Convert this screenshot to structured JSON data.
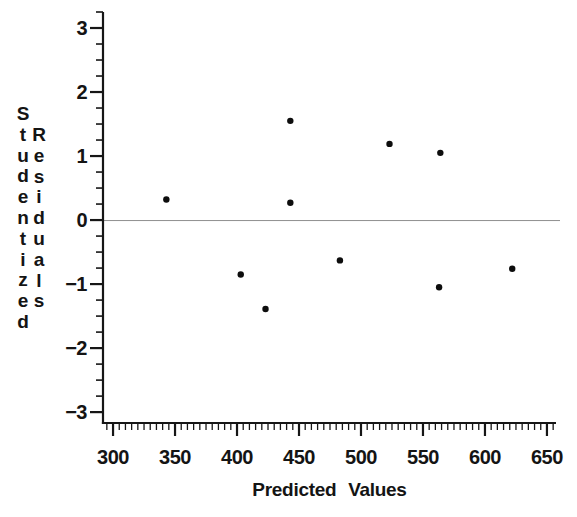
{
  "figure": {
    "xlabel": "Predicted Values",
    "ylabel": "Studentized Residuals",
    "ylabel_words": [
      "Studentized",
      "Residuals"
    ],
    "background_color": "#ffffff",
    "axis_color": "#161616",
    "text_color": "#141414"
  },
  "chart_data": {
    "type": "scatter",
    "title": "",
    "xlabel": "Predicted Values",
    "ylabel": "Studentized Residuals",
    "xlim": [
      291.9,
      657.3
    ],
    "ylim": [
      -3.17,
      3.25
    ],
    "grid": false,
    "legend": false,
    "marker_color": "#0d0d0d",
    "axis_color": "#161616",
    "reference_line_y": 0,
    "reference_line_color": "#8f8f8f",
    "x_ticks": {
      "values": [
        300,
        350,
        400,
        450,
        500,
        550,
        600,
        650
      ],
      "labels": [
        "300",
        "350",
        "400",
        "450",
        "500",
        "550",
        "600",
        "650"
      ],
      "minor_step": 5,
      "minor_range": [
        295,
        655
      ]
    },
    "y_ticks": {
      "values": [
        3,
        2,
        1,
        0,
        -1,
        -2,
        -3
      ],
      "labels": [
        "3",
        "2",
        "1",
        "0",
        "−1",
        "−2",
        "−3"
      ],
      "minor_step": 0.25,
      "minor_range": [
        -3,
        3.25
      ]
    },
    "points": [
      {
        "x": 343,
        "y": 0.32
      },
      {
        "x": 403,
        "y": -0.85
      },
      {
        "x": 423,
        "y": -1.39
      },
      {
        "x": 443,
        "y": 1.55
      },
      {
        "x": 443,
        "y": 0.27
      },
      {
        "x": 483,
        "y": -0.63
      },
      {
        "x": 523,
        "y": 1.19
      },
      {
        "x": 564,
        "y": 1.05
      },
      {
        "x": 563,
        "y": -1.05
      },
      {
        "x": 622,
        "y": -0.76
      }
    ]
  }
}
